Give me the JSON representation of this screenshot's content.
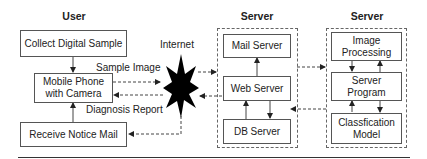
{
  "headers": {
    "user": "User",
    "server_middle": "Server",
    "server_right": "Server"
  },
  "user_column": {
    "collect": "Collect Digital Sample",
    "phone_line1": "Mobile Phone",
    "phone_line2": "with Camera",
    "receive": "Receive Notice Mail"
  },
  "internet": {
    "label": "Internet",
    "icon": "starburst-icon"
  },
  "flow_labels": {
    "sample_image": "Sample Image",
    "diagnosis_report": "Diagnosis Report"
  },
  "middle_server": {
    "mail": "Mail Server",
    "web": "Web Server",
    "db": "DB Server"
  },
  "right_server": {
    "image_line1": "Image",
    "image_line2": "Processing",
    "program_line1": "Server",
    "program_line2": "Program",
    "model_line1": "Classfication",
    "model_line2": "Model"
  }
}
